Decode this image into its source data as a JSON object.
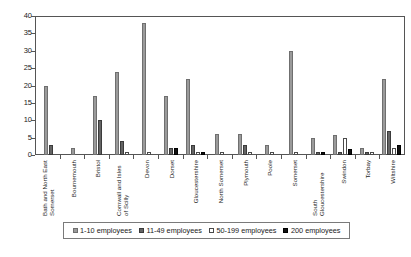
{
  "chart_data": {
    "type": "bar",
    "title": "",
    "subtitle": "",
    "xlabel": "",
    "ylabel": "",
    "ylim": [
      0,
      40
    ],
    "yticks": [
      0,
      5,
      10,
      15,
      20,
      25,
      30,
      35,
      40
    ],
    "grid": false,
    "legend_position": "bottom",
    "orientation": "vertical",
    "grouping": "grouped",
    "categories": [
      "Bath and North East Somerset",
      "Bournemouth",
      "Bristol",
      "Cornwall and Isles of Scilly",
      "Devon",
      "Dorset",
      "Gloucestershire",
      "North Somerset",
      "Plymouth",
      "Poole",
      "Somerset",
      "South Gloucestershire",
      "Swindon",
      "Torbay",
      "Wiltshire"
    ],
    "series": [
      {
        "name": "1-10 employees",
        "color": "#9a9a9a",
        "values": [
          20,
          2,
          17,
          24,
          38,
          17,
          22,
          6,
          6,
          3,
          30,
          5,
          5.7,
          2,
          22
        ]
      },
      {
        "name": "11-49 employees",
        "color": "#646464",
        "values": [
          3,
          0,
          10,
          4,
          0,
          2,
          3,
          0,
          3,
          0,
          0,
          1,
          1,
          1,
          7
        ]
      },
      {
        "name": "50-199 employees",
        "color": "#ffffff",
        "values": [
          0,
          0,
          0,
          1,
          1,
          0,
          1,
          1,
          1,
          1,
          1,
          0,
          5,
          1,
          2
        ]
      },
      {
        "name": "200  employees",
        "color": "#111111",
        "values": [
          0,
          0,
          0,
          0,
          0,
          2,
          1,
          0,
          0,
          0,
          0,
          1,
          1.7,
          0,
          3
        ]
      }
    ]
  },
  "legend": {
    "items": [
      {
        "label": "1-10 employees"
      },
      {
        "label": "11-49 employees"
      },
      {
        "label": "50-199 employees"
      },
      {
        "label": "200  employees"
      }
    ]
  },
  "axis": {
    "y_tick_labels": [
      "40",
      "35",
      "30",
      "25",
      "20",
      "15",
      "10",
      "5",
      "0"
    ]
  }
}
